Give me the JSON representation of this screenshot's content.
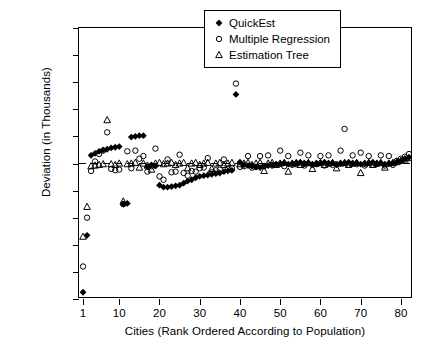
{
  "chart_data": {
    "type": "scatter",
    "title": "",
    "xlabel": "Cities (Rank Ordered According to Population)",
    "ylabel": "Deviation (in Thousands)",
    "xlim": [
      0,
      83
    ],
    "ylim": [
      -1000,
      1000
    ],
    "xticks": [
      1,
      10,
      20,
      30,
      40,
      50,
      60,
      70,
      80
    ],
    "yticks": [
      -1000,
      -800,
      -600,
      -400,
      -200,
      0,
      200,
      400,
      600,
      800,
      1000
    ],
    "grid": false,
    "zero_reference_line": true,
    "legend_position": "top-right",
    "series": [
      {
        "name": "QuickEst",
        "marker": "filled-diamond",
        "color": "#000000",
        "x": [
          1,
          2,
          3,
          4,
          5,
          6,
          7,
          8,
          9,
          10,
          11,
          12,
          13,
          14,
          15,
          16,
          17,
          18,
          19,
          20,
          21,
          22,
          23,
          24,
          25,
          26,
          27,
          28,
          29,
          30,
          31,
          32,
          33,
          34,
          35,
          36,
          37,
          38,
          39,
          40,
          41,
          42,
          43,
          44,
          45,
          46,
          47,
          48,
          49,
          50,
          51,
          52,
          53,
          54,
          55,
          56,
          57,
          58,
          59,
          60,
          61,
          62,
          63,
          64,
          65,
          66,
          67,
          68,
          69,
          70,
          71,
          72,
          73,
          74,
          75,
          76,
          77,
          78,
          79,
          80,
          81,
          82
        ],
        "y": [
          -950,
          -530,
          60,
          75,
          90,
          100,
          105,
          115,
          120,
          125,
          -300,
          -295,
          195,
          200,
          205,
          205,
          -25,
          -10,
          -20,
          -160,
          -175,
          -175,
          -170,
          -165,
          -160,
          -145,
          -130,
          -120,
          -105,
          -95,
          -90,
          -85,
          -80,
          -75,
          -70,
          -60,
          -55,
          -50,
          510,
          10,
          -10,
          -15,
          -20,
          -25,
          -30,
          -20,
          -15,
          -10,
          -5,
          0,
          5,
          -5,
          0,
          5,
          10,
          0,
          5,
          -5,
          0,
          5,
          10,
          0,
          5,
          -10,
          0,
          5,
          10,
          0,
          5,
          -5,
          0,
          5,
          10,
          0,
          5,
          -5,
          0,
          5,
          10,
          20,
          35,
          45
        ]
      },
      {
        "name": "Multiple Regression",
        "marker": "open-circle",
        "color": "#000000",
        "x": [
          1,
          2,
          3,
          4,
          5,
          6,
          7,
          8,
          9,
          10,
          11,
          12,
          13,
          14,
          15,
          16,
          17,
          18,
          19,
          20,
          21,
          22,
          23,
          24,
          25,
          26,
          27,
          28,
          29,
          30,
          31,
          32,
          33,
          34,
          35,
          36,
          37,
          38,
          39,
          40,
          41,
          42,
          43,
          44,
          45,
          46,
          47,
          48,
          49,
          50,
          51,
          52,
          53,
          54,
          55,
          56,
          57,
          58,
          59,
          60,
          61,
          62,
          63,
          64,
          65,
          66,
          67,
          68,
          69,
          70,
          71,
          72,
          73,
          74,
          75,
          76,
          77,
          78,
          79,
          80,
          81,
          82
        ],
        "y": [
          -760,
          -400,
          -55,
          15,
          70,
          95,
          230,
          -40,
          -50,
          -45,
          -300,
          90,
          -35,
          95,
          35,
          55,
          -60,
          -20,
          110,
          -95,
          -120,
          30,
          -65,
          -60,
          65,
          -70,
          -90,
          -55,
          -60,
          -35,
          -30,
          40,
          -65,
          -50,
          -45,
          30,
          -40,
          -35,
          590,
          -25,
          -20,
          55,
          -30,
          -25,
          55,
          -20,
          60,
          -15,
          -10,
          95,
          -20,
          55,
          -10,
          -5,
          80,
          -15,
          60,
          -10,
          -5,
          55,
          -15,
          60,
          -10,
          -5,
          95,
          255,
          -10,
          60,
          -5,
          80,
          -15,
          55,
          -10,
          -5,
          60,
          -15,
          55,
          -10,
          20,
          35,
          50,
          70
        ]
      },
      {
        "name": "Estimation Tree",
        "marker": "open-triangle",
        "color": "#000000",
        "x": [
          1,
          2,
          3,
          4,
          5,
          6,
          7,
          8,
          9,
          10,
          11,
          12,
          13,
          14,
          15,
          16,
          17,
          18,
          19,
          20,
          21,
          22,
          23,
          24,
          25,
          26,
          27,
          28,
          29,
          30,
          31,
          32,
          33,
          34,
          35,
          36,
          37,
          38,
          39,
          40,
          41,
          42,
          43,
          44,
          45,
          46,
          47,
          48,
          49,
          50,
          51,
          52,
          53,
          54,
          55,
          56,
          57,
          58,
          59,
          60,
          61,
          62,
          63,
          64,
          65,
          66,
          67,
          68,
          69,
          70,
          71,
          72,
          73,
          74,
          75,
          76,
          77,
          78,
          79,
          80,
          81,
          82
        ],
        "y": [
          -540,
          -320,
          -20,
          -15,
          -10,
          -5,
          320,
          -5,
          -10,
          0,
          -280,
          -5,
          0,
          5,
          -30,
          0,
          -15,
          -45,
          0,
          5,
          -5,
          0,
          5,
          -10,
          0,
          5,
          -35,
          0,
          5,
          -10,
          0,
          5,
          -40,
          0,
          5,
          -10,
          0,
          5,
          730,
          -5,
          0,
          5,
          -10,
          0,
          5,
          -55,
          0,
          5,
          -10,
          0,
          5,
          -60,
          0,
          5,
          -10,
          0,
          5,
          -40,
          0,
          5,
          -10,
          0,
          5,
          -35,
          0,
          5,
          -10,
          0,
          5,
          -70,
          0,
          5,
          -10,
          0,
          5,
          -30,
          0,
          5,
          10,
          20,
          30,
          40
        ]
      }
    ]
  },
  "legend": {
    "items": [
      {
        "label": "QuickEst",
        "marker": "filled-diamond"
      },
      {
        "label": "Multiple Regression",
        "marker": "open-circle"
      },
      {
        "label": "Estimation Tree",
        "marker": "open-triangle"
      }
    ]
  }
}
